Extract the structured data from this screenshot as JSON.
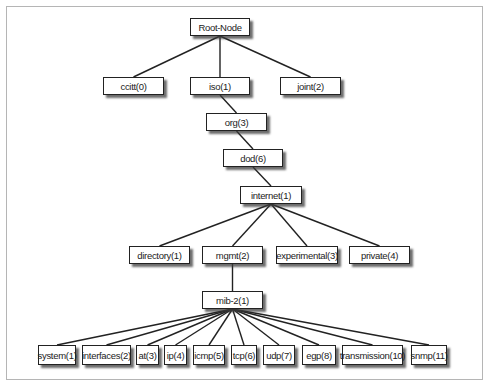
{
  "diagram": {
    "type": "tree",
    "title": "",
    "nodes": [
      {
        "id": "root",
        "label": "Root-Node"
      },
      {
        "id": "ccitt",
        "label": "ccitt(0)"
      },
      {
        "id": "iso",
        "label": "iso(1)"
      },
      {
        "id": "joint",
        "label": "joint(2)"
      },
      {
        "id": "org",
        "label": "org(3)"
      },
      {
        "id": "dod",
        "label": "dod(6)"
      },
      {
        "id": "internet",
        "label": "internet(1)"
      },
      {
        "id": "directory",
        "label": "directory(1)"
      },
      {
        "id": "mgmt",
        "label": "mgmt(2)"
      },
      {
        "id": "experimental",
        "label": "experimental(3)"
      },
      {
        "id": "private",
        "label": "private(4)"
      },
      {
        "id": "mib2",
        "label": "mib-2(1)"
      },
      {
        "id": "system",
        "label": "system(1)"
      },
      {
        "id": "interfaces",
        "label": "interfaces(2)"
      },
      {
        "id": "at",
        "label": "at(3)"
      },
      {
        "id": "ip",
        "label": "ip(4)"
      },
      {
        "id": "icmp",
        "label": "icmp(5)"
      },
      {
        "id": "tcp",
        "label": "tcp(6)"
      },
      {
        "id": "udp",
        "label": "udp(7)"
      },
      {
        "id": "egp",
        "label": "egp(8)"
      },
      {
        "id": "transmission",
        "label": "transmission(10)"
      },
      {
        "id": "snmp",
        "label": "snmp(11)"
      }
    ],
    "edges": [
      [
        "root",
        "ccitt"
      ],
      [
        "root",
        "iso"
      ],
      [
        "root",
        "joint"
      ],
      [
        "iso",
        "org"
      ],
      [
        "org",
        "dod"
      ],
      [
        "dod",
        "internet"
      ],
      [
        "internet",
        "directory"
      ],
      [
        "internet",
        "mgmt"
      ],
      [
        "internet",
        "experimental"
      ],
      [
        "internet",
        "private"
      ],
      [
        "mgmt",
        "mib2"
      ],
      [
        "mib2",
        "system"
      ],
      [
        "mib2",
        "interfaces"
      ],
      [
        "mib2",
        "at"
      ],
      [
        "mib2",
        "ip"
      ],
      [
        "mib2",
        "icmp"
      ],
      [
        "mib2",
        "tcp"
      ],
      [
        "mib2",
        "udp"
      ],
      [
        "mib2",
        "egp"
      ],
      [
        "mib2",
        "transmission"
      ],
      [
        "mib2",
        "snmp"
      ]
    ]
  }
}
